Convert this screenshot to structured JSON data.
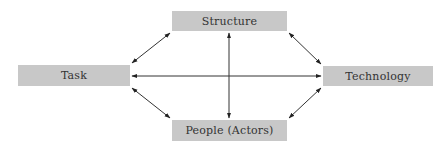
{
  "diagram": {
    "type": "relationship-diamond",
    "colors": {
      "box_fill": "#c8c8c8",
      "text": "#333333",
      "arrow": "#222222"
    },
    "nodes": {
      "structure": {
        "label": "Structure"
      },
      "task": {
        "label": "Task"
      },
      "technology": {
        "label": "Technology"
      },
      "people": {
        "label": "People (Actors)"
      }
    },
    "edges": [
      {
        "from": "task",
        "to": "structure",
        "direction": "both"
      },
      {
        "from": "structure",
        "to": "technology",
        "direction": "both"
      },
      {
        "from": "task",
        "to": "people",
        "direction": "both"
      },
      {
        "from": "people",
        "to": "technology",
        "direction": "both"
      },
      {
        "from": "task",
        "to": "technology",
        "direction": "both"
      },
      {
        "from": "structure",
        "to": "people",
        "direction": "both"
      }
    ]
  }
}
